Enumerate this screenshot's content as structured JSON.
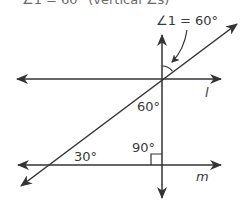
{
  "header": {
    "text": "∠1 = 60° (vertical ∠s)"
  },
  "diagram": {
    "colors": {
      "line": "#333333",
      "text": "#3a3a3a"
    },
    "labels": {
      "angle1": "∠1 = 60°",
      "angle_60": "60°",
      "angle_90": "90°",
      "angle_30": "30°",
      "line_l": "l",
      "line_m": "m"
    },
    "lines": [
      {
        "name": "line-l",
        "from": [
          17,
          79
        ],
        "to": [
          221,
          79
        ],
        "arrows": "both"
      },
      {
        "name": "line-m",
        "from": [
          18,
          165
        ],
        "to": [
          221,
          165
        ],
        "arrows": "both"
      },
      {
        "name": "vertical-transversal",
        "from": [
          162,
          198
        ],
        "to": [
          162,
          35
        ],
        "arrows": "both"
      },
      {
        "name": "diagonal-transversal",
        "from": [
          21,
          186
        ],
        "to": [
          237,
          24
        ],
        "arrows": "both"
      }
    ]
  }
}
